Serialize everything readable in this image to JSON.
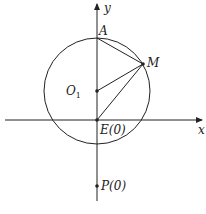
{
  "diagram": {
    "axes": {
      "x_label": "x",
      "y_label": "y"
    },
    "points": {
      "A": {
        "label": "A"
      },
      "M": {
        "label": "M"
      },
      "O1": {
        "label": "O",
        "sub": "1"
      },
      "E": {
        "label": "E(0)"
      },
      "P": {
        "label": "P(0)"
      }
    },
    "colors": {
      "stroke": "#222222",
      "background": "#ffffff"
    }
  }
}
